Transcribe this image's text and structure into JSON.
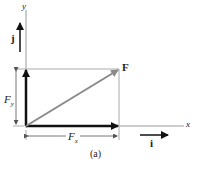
{
  "figure": {
    "caption": "(a)",
    "axis_x_label": "x",
    "axis_y_label": "y",
    "unit_i_label": "i",
    "unit_j_label": "j",
    "force_label": "F",
    "fx_label": "F",
    "fx_sub": "x",
    "fy_label": "F",
    "fy_sub": "y"
  },
  "colors": {
    "vector": "#111111",
    "resultant": "#8a8a8a",
    "axis": "#999999"
  }
}
